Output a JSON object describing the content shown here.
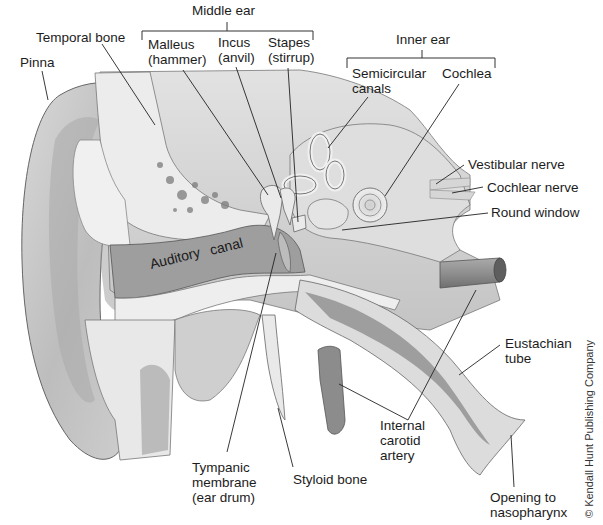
{
  "diagram": {
    "groups": {
      "middle_ear": "Middle ear",
      "inner_ear": "Inner ear"
    },
    "labels": {
      "temporal_bone": "Temporal bone",
      "pinna": "Pinna",
      "malleus_1": "Malleus",
      "malleus_2": "(hammer)",
      "incus_1": "Incus",
      "incus_2": "(anvil)",
      "stapes_1": "Stapes",
      "stapes_2": "(stirrup)",
      "semicircular_1": "Semicircular",
      "semicircular_2": "canals",
      "cochlea": "Cochlea",
      "vestibular_nerve": "Vestibular nerve",
      "cochlear_nerve": "Cochlear nerve",
      "round_window": "Round window",
      "auditory": "Auditory",
      "canal": "canal",
      "eustachian_1": "Eustachian",
      "eustachian_2": "tube",
      "internal_carotid_1": "Internal",
      "internal_carotid_2": "carotid",
      "internal_carotid_3": "artery",
      "tympanic_1": "Tympanic",
      "tympanic_2": "membrane",
      "tympanic_3": "(ear drum)",
      "styloid": "Styloid bone",
      "opening_1": "Opening to",
      "opening_2": "nasopharynx"
    },
    "copyright": "© Kendall Hunt Publishing Company"
  },
  "colors": {
    "background": "#ffffff",
    "ink": "#1c1c1c",
    "tissue_light": "#e6e6e6",
    "tissue_mid": "#bdbdbd",
    "tissue_dark": "#8a8a8a",
    "canal_fill": "#9c9c9c",
    "bone_fill": "#efefef"
  }
}
